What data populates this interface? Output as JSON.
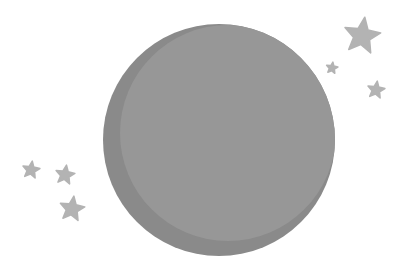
{
  "scene": {
    "title": "Moon and stars illustration",
    "colors": {
      "background": "#ffffff",
      "moon_shadow": "#8a8a8a",
      "moon_face": "#979797",
      "star": "#b3b3b3"
    },
    "moon": {
      "cx": 219,
      "cy": 140,
      "r": 116,
      "face_cx": 228,
      "face_cy": 133,
      "face_r": 108
    },
    "stars": [
      {
        "name": "star-top-right-large",
        "cx": 362,
        "cy": 36,
        "r": 19
      },
      {
        "name": "star-top-right-small",
        "cx": 332,
        "cy": 68,
        "r": 6
      },
      {
        "name": "star-right-medium",
        "cx": 376,
        "cy": 90,
        "r": 9
      },
      {
        "name": "star-left-small",
        "cx": 31,
        "cy": 170,
        "r": 9
      },
      {
        "name": "star-left-medium",
        "cx": 65,
        "cy": 175,
        "r": 10
      },
      {
        "name": "star-left-bottom",
        "cx": 72,
        "cy": 209,
        "r": 13
      }
    ]
  }
}
